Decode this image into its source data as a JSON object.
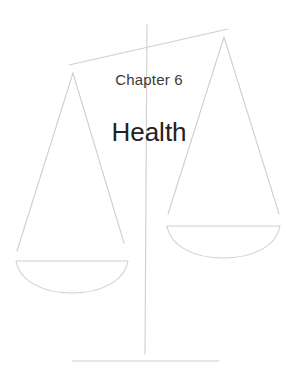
{
  "chapter": {
    "label": "Chapter 6",
    "title": "Health"
  },
  "illustration": {
    "name": "balance-scale",
    "stroke_color": "#cfcfcf",
    "text_color_label": "#3a3a3a",
    "text_color_title": "#222222"
  }
}
